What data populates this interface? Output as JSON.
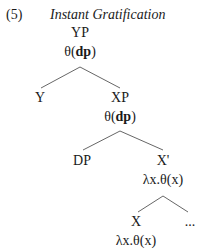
{
  "example": {
    "number": "(5)",
    "title": "Instant Gratification"
  },
  "tree": {
    "root": {
      "label": "YP",
      "sem_pre": "θ(",
      "sem_bold": "dp",
      "sem_post": ")"
    },
    "y": {
      "label": "Y"
    },
    "xp": {
      "label": "XP",
      "sem_pre": "θ(",
      "sem_bold": "dp",
      "sem_post": ")"
    },
    "dp": {
      "label": "DP"
    },
    "xbar": {
      "label": "X'",
      "sem": "λx.θ(x)"
    },
    "x": {
      "label": "X",
      "sem": "λx.θ(x)"
    },
    "ellipsis": {
      "label": "..."
    }
  },
  "edges": [
    {
      "from": "YP",
      "to": "Y"
    },
    {
      "from": "YP",
      "to": "XP"
    },
    {
      "from": "XP",
      "to": "DP"
    },
    {
      "from": "XP",
      "to": "X'"
    },
    {
      "from": "X'",
      "to": "X"
    },
    {
      "from": "X'",
      "to": "..."
    }
  ]
}
